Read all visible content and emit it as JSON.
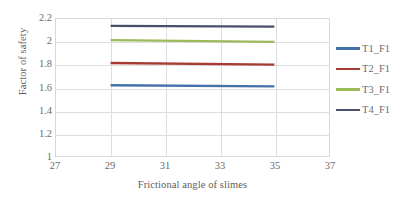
{
  "chart_data": {
    "type": "line",
    "title": "",
    "xlabel": "Frictional angle of slimes",
    "ylabel": "Factor of safety",
    "xlim": [
      27,
      37
    ],
    "ylim": [
      1,
      2.2
    ],
    "xticks": [
      "27",
      "29",
      "31",
      "33",
      "35",
      "37"
    ],
    "yticks": [
      "1",
      "1.2",
      "1.4",
      "1.6",
      "1.8",
      "2",
      "2.2"
    ],
    "grid": "both",
    "legend_position": "right",
    "x": [
      29,
      35
    ],
    "series": [
      {
        "name": "T1_F1",
        "values": [
          1.62,
          1.61
        ],
        "color": "#4472a8"
      },
      {
        "name": "T2_F1",
        "values": [
          1.815,
          1.8
        ],
        "color": "#a63b33"
      },
      {
        "name": "T3_F1",
        "values": [
          2.015,
          2.0
        ],
        "color": "#9bba5a"
      },
      {
        "name": "T4_F1",
        "values": [
          2.14,
          2.133
        ],
        "color": "#4a4e69"
      }
    ]
  },
  "legend": {
    "items": [
      {
        "label": "T1_F1"
      },
      {
        "label": "T2_F1"
      },
      {
        "label": "T3_F1"
      },
      {
        "label": "T4_F1"
      }
    ]
  },
  "colors": {
    "axis_text": "#6d6d6d",
    "gridline": "#dedede",
    "plot_border": "#d9d9d9",
    "background": "#ffffff"
  }
}
